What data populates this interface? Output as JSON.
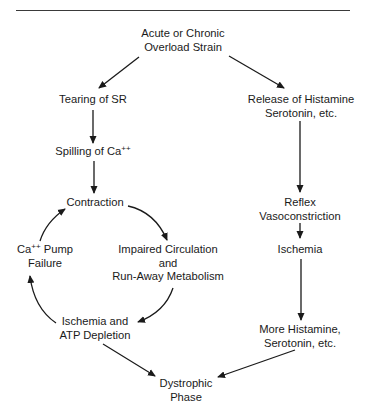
{
  "diagram": {
    "type": "flowchart",
    "nodes": {
      "overload": {
        "lines": [
          "Acute or Chronic",
          "Overload Strain"
        ]
      },
      "tearing": {
        "lines": [
          "Tearing of SR"
        ]
      },
      "release": {
        "lines": [
          "Release of Histamine",
          "Serotonin, etc."
        ]
      },
      "spilling": {
        "text": "Spilling of Ca",
        "sup": "++"
      },
      "contraction": {
        "lines": [
          "Contraction"
        ]
      },
      "reflex": {
        "lines": [
          "Reflex",
          "Vasoconstriction"
        ]
      },
      "ischemia_right": {
        "lines": [
          "Ischemia"
        ]
      },
      "pump_failure": {
        "prefix": "Ca",
        "sup": "++",
        "suffix": " Pump",
        "line2": "Failure"
      },
      "impaired": {
        "lines": [
          "Impaired Circulation",
          "and",
          "Run-Away Metabolism"
        ]
      },
      "ischemia_atp": {
        "lines": [
          "Ischemia and",
          "ATP Depletion"
        ]
      },
      "more_histamine": {
        "lines": [
          "More Histamine,",
          "Serotonin, etc."
        ]
      },
      "dystrophic": {
        "lines": [
          "Dystrophic",
          "Phase"
        ]
      }
    },
    "edges": [
      {
        "from": "Acute or Chronic Overload Strain",
        "to": "Tearing of SR"
      },
      {
        "from": "Acute or Chronic Overload Strain",
        "to": "Release of Histamine Serotonin, etc."
      },
      {
        "from": "Tearing of SR",
        "to": "Spilling of Ca++"
      },
      {
        "from": "Spilling of Ca++",
        "to": "Contraction"
      },
      {
        "from": "Contraction",
        "to": "Impaired Circulation and Run-Away Metabolism"
      },
      {
        "from": "Impaired Circulation and Run-Away Metabolism",
        "to": "Ischemia and ATP Depletion"
      },
      {
        "from": "Ischemia and ATP Depletion",
        "to": "Ca++ Pump Failure"
      },
      {
        "from": "Ca++ Pump Failure",
        "to": "Contraction"
      },
      {
        "from": "Release of Histamine Serotonin, etc.",
        "to": "Reflex Vasoconstriction"
      },
      {
        "from": "Reflex Vasoconstriction",
        "to": "Ischemia"
      },
      {
        "from": "Ischemia",
        "to": "More Histamine, Serotonin, etc."
      },
      {
        "from": "Ischemia and ATP Depletion",
        "to": "Dystrophic Phase"
      },
      {
        "from": "More Histamine, Serotonin, etc.",
        "to": "Dystrophic Phase"
      }
    ],
    "colors": {
      "ink": "#1a1a1a",
      "background": "#ffffff"
    }
  }
}
